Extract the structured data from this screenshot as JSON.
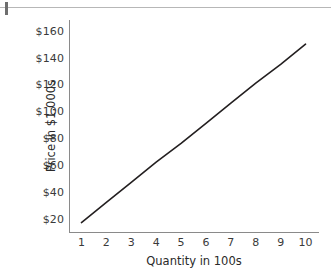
{
  "chart_data": {
    "type": "line",
    "title": "",
    "xlabel": "Quantity in 100s",
    "ylabel": "Price in $1,000s",
    "xlim": [
      0.5,
      10.5
    ],
    "ylim": [
      10,
      168
    ],
    "grid": false,
    "legend": null,
    "x_tick_labels": [
      "1",
      "2",
      "3",
      "4",
      "5",
      "6",
      "7",
      "8",
      "9",
      "10"
    ],
    "x_tick_values": [
      1,
      2,
      3,
      4,
      5,
      6,
      7,
      8,
      9,
      10
    ],
    "y_tick_labels": [
      "$20",
      "$40",
      "$60",
      "$80",
      "$100",
      "$120",
      "$140",
      "$160"
    ],
    "y_tick_values": [
      20,
      40,
      60,
      80,
      100,
      120,
      140,
      160
    ],
    "series": [
      {
        "name": "supply-line",
        "color": "#231f20",
        "x": [
          1,
          2,
          3,
          4,
          5,
          6,
          7,
          8,
          9,
          10
        ],
        "values": [
          17,
          32,
          47,
          62,
          76,
          91,
          106,
          121,
          135,
          150
        ]
      }
    ],
    "line_endpoints": {
      "start": {
        "x": 1,
        "y": 17
      },
      "end": {
        "x": 10,
        "y": 150
      }
    }
  },
  "colors": {
    "line": "#231f20",
    "axis": "#8a8a8a",
    "tick_text": "#3a3a3a",
    "title_text": "#2a2a2a",
    "page_rule": "#b7b7b7",
    "corner_stub": "#6e6e6e",
    "background": "#ffffff"
  }
}
